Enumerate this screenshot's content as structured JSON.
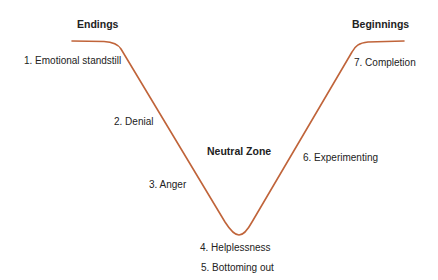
{
  "diagram": {
    "type": "transition-curve",
    "curve_color": "#c0643a",
    "headings": {
      "endings": "Endings",
      "beginnings": "Beginnings",
      "neutral_zone": "Neutral Zone"
    },
    "stages": [
      {
        "label": "1. Emotional standstill"
      },
      {
        "label": "2. Denial"
      },
      {
        "label": "3. Anger"
      },
      {
        "label": "4. Helplessness"
      },
      {
        "label": "5. Bottoming out"
      },
      {
        "label": "6. Experimenting"
      },
      {
        "label": "7. Completion"
      }
    ]
  }
}
